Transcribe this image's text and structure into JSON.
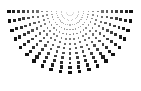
{
  "figure": {
    "background_color": "#ffffff",
    "width": 141,
    "height": 91
  },
  "chart_data": {
    "type": "scatter",
    "title": "",
    "subtitle": "",
    "xlabel": "",
    "ylabel": "",
    "xlim": [
      0,
      141
    ],
    "ylim": [
      0,
      91
    ],
    "grid": false,
    "legend": null,
    "annotations": [],
    "tick_labels": {
      "x": [],
      "y": []
    },
    "marker": {
      "shape": "square",
      "color": "#121212",
      "min_size": 0.7,
      "max_size": 3.4,
      "size_grows_with_radius": true,
      "opacity_min": 0.12,
      "opacity_max": 1.0
    },
    "geometry": {
      "apex_x": 70,
      "apex_y": 11.5,
      "ray_count": 21,
      "angle_start_deg": 0,
      "angle_end_deg": 180,
      "dots_per_ray": 13,
      "radius_min": 4.0,
      "radius_max": 61.0,
      "radius_spacing": "linear"
    },
    "series": [
      {
        "name": "ray-00",
        "angle_deg": 0,
        "values": [
          {
            "r": 4.0,
            "x": 74.0,
            "y": 11.5,
            "size": 0.75,
            "alpha": 0.13
          },
          {
            "r": 8.75,
            "x": 78.8,
            "y": 11.5,
            "size": 0.95,
            "alpha": 0.2
          },
          {
            "r": 13.5,
            "x": 83.5,
            "y": 11.5,
            "size": 1.15,
            "alpha": 0.28
          },
          {
            "r": 18.25,
            "x": 88.3,
            "y": 11.5,
            "size": 1.35,
            "alpha": 0.36
          },
          {
            "r": 23.0,
            "x": 93.0,
            "y": 11.5,
            "size": 1.55,
            "alpha": 0.45
          },
          {
            "r": 27.75,
            "x": 97.8,
            "y": 11.5,
            "size": 1.8,
            "alpha": 0.53
          },
          {
            "r": 32.5,
            "x": 102.5,
            "y": 11.5,
            "size": 2.0,
            "alpha": 0.62
          },
          {
            "r": 37.25,
            "x": 107.3,
            "y": 11.5,
            "size": 2.2,
            "alpha": 0.7
          },
          {
            "r": 42.0,
            "x": 112.0,
            "y": 11.5,
            "size": 2.45,
            "alpha": 0.79
          },
          {
            "r": 46.75,
            "x": 116.8,
            "y": 11.5,
            "size": 2.65,
            "alpha": 0.87
          },
          {
            "r": 51.5,
            "x": 121.5,
            "y": 11.5,
            "size": 2.9,
            "alpha": 0.93
          },
          {
            "r": 56.25,
            "x": 126.3,
            "y": 11.5,
            "size": 3.1,
            "alpha": 0.98
          },
          {
            "r": 61.0,
            "x": 131.0,
            "y": 11.5,
            "size": 3.35,
            "alpha": 1.0
          }
        ]
      },
      {
        "name": "ray-09",
        "angle_deg": 81,
        "values": [
          {
            "r": 4.0,
            "x": 70.6,
            "y": 15.5,
            "size": 0.75,
            "alpha": 0.13
          },
          {
            "r": 23.0,
            "x": 73.6,
            "y": 34.2,
            "size": 1.55,
            "alpha": 0.45
          },
          {
            "r": 42.0,
            "x": 76.6,
            "y": 53.0,
            "size": 2.45,
            "alpha": 0.79
          },
          {
            "r": 61.0,
            "x": 79.5,
            "y": 71.7,
            "size": 3.35,
            "alpha": 1.0
          }
        ]
      },
      {
        "name": "ray-10",
        "angle_deg": 90,
        "values": [
          {
            "r": 4.0,
            "x": 70.0,
            "y": 15.5,
            "size": 0.75,
            "alpha": 0.13
          },
          {
            "r": 23.0,
            "x": 70.0,
            "y": 34.5,
            "size": 1.55,
            "alpha": 0.45
          },
          {
            "r": 42.0,
            "x": 70.0,
            "y": 53.5,
            "size": 2.45,
            "alpha": 0.79
          },
          {
            "r": 61.0,
            "x": 70.0,
            "y": 72.5,
            "size": 3.35,
            "alpha": 1.0
          }
        ]
      },
      {
        "name": "ray-20",
        "angle_deg": 180,
        "values": [
          {
            "r": 4.0,
            "x": 66.0,
            "y": 11.5,
            "size": 0.75,
            "alpha": 0.13
          },
          {
            "r": 23.0,
            "x": 47.0,
            "y": 11.5,
            "size": 1.55,
            "alpha": 0.45
          },
          {
            "r": 42.0,
            "x": 28.0,
            "y": 11.5,
            "size": 2.45,
            "alpha": 0.79
          },
          {
            "r": 61.0,
            "x": 9.0,
            "y": 11.5,
            "size": 3.35,
            "alpha": 1.0
          }
        ]
      }
    ]
  }
}
